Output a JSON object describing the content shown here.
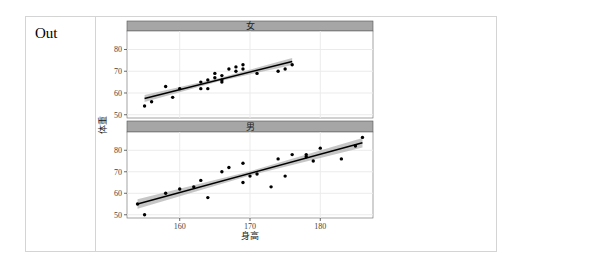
{
  "cell": {
    "prompt_label": "Out"
  },
  "chart_data": {
    "type": "scatter",
    "subtype": "faceted scatter with linear regression and confidence band",
    "xlabel": "身高",
    "ylabel": "体重",
    "x_ticks": [
      160,
      170,
      180
    ],
    "y_ticks": [
      50,
      60,
      70,
      80
    ],
    "xlim": [
      152.5,
      187.5
    ],
    "ylim": [
      48.5,
      88.5
    ],
    "grid": true,
    "colors": {
      "points": "#000000",
      "line": "#000000",
      "band": "#b3b3b3",
      "strip": "#a6a6a6",
      "grid": "#ebebeb"
    },
    "facets": [
      {
        "label": "女",
        "points": [
          [
            155,
            54
          ],
          [
            156,
            56
          ],
          [
            158,
            63
          ],
          [
            159,
            58
          ],
          [
            160,
            62
          ],
          [
            163,
            65
          ],
          [
            163,
            62
          ],
          [
            164,
            66
          ],
          [
            164,
            62
          ],
          [
            165,
            69
          ],
          [
            165,
            67
          ],
          [
            166,
            68
          ],
          [
            166,
            66
          ],
          [
            166,
            65
          ],
          [
            167,
            71
          ],
          [
            168,
            72
          ],
          [
            168,
            70
          ],
          [
            169,
            73
          ],
          [
            169,
            71
          ],
          [
            171,
            69
          ],
          [
            174,
            70
          ],
          [
            175,
            71
          ],
          [
            176,
            73
          ]
        ],
        "fit": {
          "x": [
            155,
            176
          ],
          "y": [
            57.5,
            74.5
          ],
          "band": 1.6
        }
      },
      {
        "label": "男",
        "points": [
          [
            154,
            55
          ],
          [
            155,
            50
          ],
          [
            158,
            60
          ],
          [
            160,
            62
          ],
          [
            162,
            63
          ],
          [
            163,
            66
          ],
          [
            164,
            58
          ],
          [
            166,
            70
          ],
          [
            167,
            72
          ],
          [
            169,
            74
          ],
          [
            169,
            65
          ],
          [
            170,
            68
          ],
          [
            171,
            69
          ],
          [
            173,
            63
          ],
          [
            174,
            76
          ],
          [
            175,
            68
          ],
          [
            176,
            78
          ],
          [
            178,
            78
          ],
          [
            178,
            77
          ],
          [
            179,
            75
          ],
          [
            180,
            81
          ],
          [
            183,
            76
          ],
          [
            185,
            82
          ],
          [
            186,
            86
          ]
        ],
        "fit": {
          "x": [
            154,
            186
          ],
          "y": [
            55,
            83.5
          ],
          "band": 2.2
        }
      }
    ]
  }
}
